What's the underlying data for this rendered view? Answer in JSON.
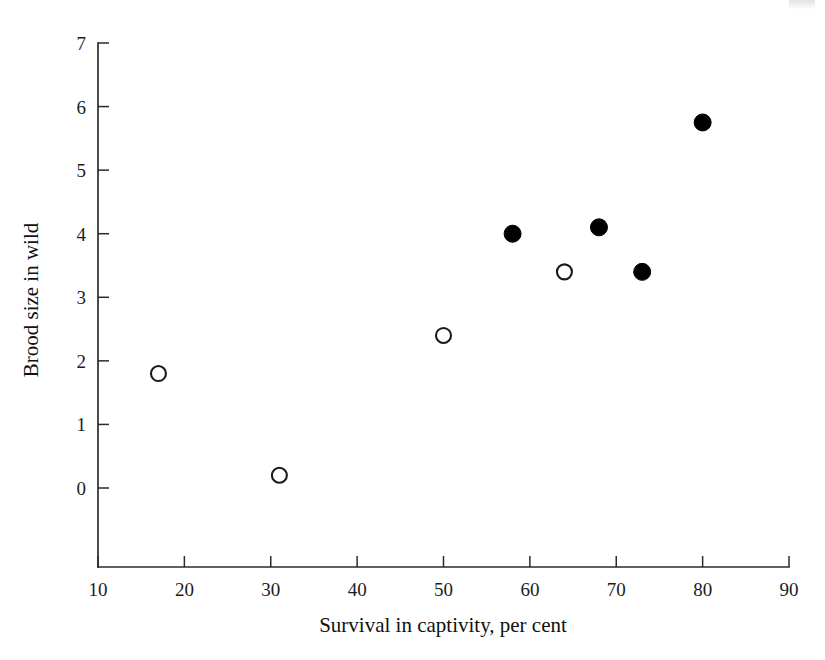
{
  "chart_data": {
    "type": "scatter",
    "title": "",
    "xlabel": "Survival in captivity, per cent",
    "ylabel": "Brood size in wild",
    "xlim": [
      10,
      90
    ],
    "ylim": [
      0,
      7
    ],
    "grid": false,
    "legend": null,
    "x_ticks": [
      "10",
      "20",
      "30",
      "40",
      "50",
      "60",
      "70",
      "80",
      "90"
    ],
    "y_ticks": [
      "0",
      "1",
      "2",
      "3",
      "4",
      "5",
      "6",
      "7"
    ],
    "series": [
      {
        "name": "open-circle-group",
        "marker": "open-circle",
        "color": "#1a1a1a",
        "points": [
          {
            "x": 17,
            "y": 1.8
          },
          {
            "x": 31,
            "y": 0.2
          },
          {
            "x": 50,
            "y": 2.4
          },
          {
            "x": 64,
            "y": 3.4
          }
        ]
      },
      {
        "name": "filled-circle-group",
        "marker": "filled-circle",
        "color": "#000000",
        "points": [
          {
            "x": 58,
            "y": 4.0
          },
          {
            "x": 68,
            "y": 4.1
          },
          {
            "x": 73,
            "y": 3.4
          },
          {
            "x": 80,
            "y": 5.75
          }
        ]
      }
    ]
  },
  "colors": {
    "axis": "#2b2b2b",
    "text": "#1a1a1a",
    "filled_marker": "#000000",
    "open_marker_fill": "#ffffff",
    "background": "#ffffff"
  }
}
